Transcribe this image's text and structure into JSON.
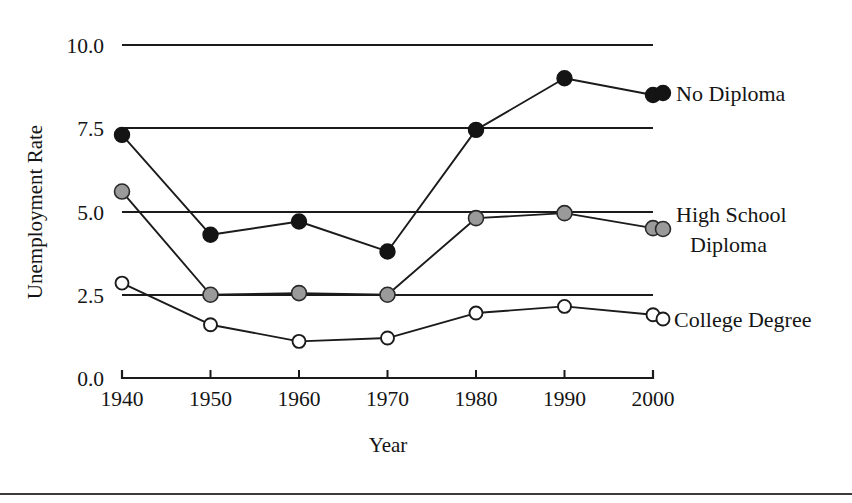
{
  "chart_data": {
    "type": "line",
    "title": "",
    "xlabel": "Year",
    "ylabel": "Unemployment Rate",
    "x": [
      1940,
      1950,
      1960,
      1970,
      1980,
      1990,
      2000
    ],
    "xticklabels": [
      "1940",
      "1950",
      "1960",
      "1970",
      "1980",
      "1990",
      "2000"
    ],
    "yticklabels": [
      "10.0",
      "7.5",
      "5.0",
      "2.5",
      "0.0"
    ],
    "yticks": [
      10.0,
      7.5,
      5.0,
      2.5,
      0.0
    ],
    "ylim": [
      0.0,
      10.0
    ],
    "xlim": [
      1940,
      2000
    ],
    "grid": true,
    "grid_axis": "y",
    "legend_position": "right-inline",
    "series": [
      {
        "name": "No Diploma",
        "marker": "filled-circle",
        "marker_color": "#141414",
        "line_color": "#1b1b1b",
        "values": [
          7.3,
          4.3,
          4.7,
          3.8,
          7.45,
          9.0,
          8.5
        ]
      },
      {
        "name": "High School Diploma",
        "marker": "gray-circle",
        "marker_color": "#9a9a9a",
        "line_color": "#1b1b1b",
        "values": [
          5.6,
          2.5,
          2.55,
          2.5,
          4.8,
          4.95,
          4.5
        ]
      },
      {
        "name": "College Degree",
        "marker": "open-circle",
        "marker_color": "#ffffff",
        "line_color": "#1b1b1b",
        "values": [
          2.85,
          1.6,
          1.1,
          1.2,
          1.95,
          2.15,
          1.9
        ]
      }
    ],
    "legend_entries": [
      {
        "label": "No Diploma",
        "lines": [
          "No Diploma"
        ]
      },
      {
        "label": "High School Diploma",
        "lines": [
          "High School",
          "Diploma"
        ]
      },
      {
        "label": "College Degree",
        "lines": [
          "College Degree"
        ]
      }
    ]
  }
}
